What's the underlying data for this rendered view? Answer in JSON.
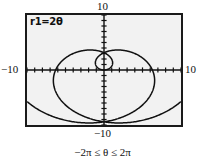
{
  "figure": {
    "name": "polar-spiral-calculator-screen",
    "caption": "−2π ≤ θ ≤ 2π",
    "equation_readout": "r1=2θ",
    "axis_labels": {
      "top": "10",
      "bottom": "−10",
      "left": "−10",
      "right": "10"
    },
    "colors": {
      "screen_background": "#f2f2f2",
      "frame": "#1a1a1a",
      "curve": "#111111",
      "axis": "#111111",
      "page_background": "#ffffff"
    }
  },
  "chart_data": {
    "type": "line",
    "title": "r1=2θ",
    "subtitle": "−2π ≤ θ ≤ 2π",
    "coordinate_system": "polar",
    "equation": "r = 2θ",
    "xlabel": "",
    "ylabel": "",
    "xlim": [
      -10,
      10
    ],
    "ylim": [
      -10,
      10
    ],
    "xticks": [
      -10,
      -9,
      -8,
      -7,
      -6,
      -5,
      -4,
      -3,
      -2,
      -1,
      0,
      1,
      2,
      3,
      4,
      5,
      6,
      7,
      8,
      9,
      10
    ],
    "yticks": [
      -10,
      -9,
      -8,
      -7,
      -6,
      -5,
      -4,
      -3,
      -2,
      -1,
      0,
      1,
      2,
      3,
      4,
      5,
      6,
      7,
      8,
      9,
      10
    ],
    "xtick_labels": [
      "−10",
      "10"
    ],
    "ytick_labels": [
      "−10",
      "10"
    ],
    "grid": false,
    "legend": null,
    "theta_min": -6.283185307179586,
    "theta_max": 6.283185307179586,
    "theta_step": 0.0654498469497874,
    "series": [
      {
        "name": "r1=2θ",
        "theta": [
          -6.2832,
          -6.0,
          -5.7,
          -5.4,
          -5.1,
          -4.8,
          -4.5,
          -4.2,
          -3.9,
          -3.6,
          -3.3,
          -3.0,
          -2.7,
          -2.4,
          -2.1,
          -1.8,
          -1.5,
          -1.2,
          -0.9,
          -0.6,
          -0.3,
          0.0,
          0.3,
          0.6,
          0.9,
          1.2,
          1.5,
          1.8,
          2.1,
          2.4,
          2.7,
          3.0,
          3.3,
          3.6,
          3.9,
          4.2,
          4.5,
          4.8,
          5.1,
          5.4,
          5.7,
          6.0,
          6.2832
        ],
        "r": [
          -12.5664,
          -12.0,
          -11.4,
          -10.8,
          -10.2,
          -9.6,
          -9.0,
          -8.4,
          -7.8,
          -7.2,
          -6.6,
          -6.0,
          -5.4,
          -4.8,
          -4.2,
          -3.6,
          -3.0,
          -2.4,
          -1.8,
          -1.2,
          -0.6,
          0.0,
          0.6,
          1.2,
          1.8,
          2.4,
          3.0,
          3.6,
          4.2,
          4.8,
          5.4,
          6.0,
          6.6,
          7.2,
          7.8,
          8.4,
          9.0,
          9.6,
          10.2,
          10.8,
          11.4,
          12.0,
          12.5664
        ]
      }
    ],
    "annotations": [
      {
        "text": "r1=2θ",
        "position": "top-left-inside-screen"
      },
      {
        "text": "10",
        "position": "above-screen-center"
      },
      {
        "text": "−10",
        "position": "below-screen-center"
      },
      {
        "text": "−10",
        "position": "left-of-screen-center"
      },
      {
        "text": "10",
        "position": "right-of-screen-center"
      },
      {
        "text": "−2π ≤ θ ≤ 2π",
        "position": "below-figure"
      }
    ]
  }
}
